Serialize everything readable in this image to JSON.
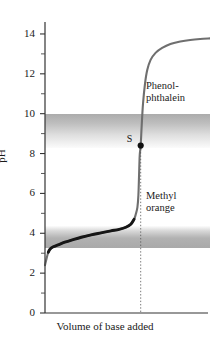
{
  "figure": {
    "kind": "titration-curve"
  },
  "axes": {
    "y_label": "pH",
    "x_label": "Volume of base added",
    "y_ticks_labeled": [
      "14",
      "12",
      "10",
      "8",
      "6",
      "4",
      "2",
      "0"
    ],
    "y_tick_values": [
      14,
      12,
      10,
      8,
      6,
      4,
      2,
      0
    ],
    "y_minor_values": [
      13,
      11,
      9,
      7,
      5,
      3,
      1
    ]
  },
  "annotations": {
    "phenolphthalein_line1": "Phenol-",
    "phenolphthalein_line2": "phthalein",
    "methylorange_line1": "Methyl",
    "methylorange_line2": "orange",
    "equivalence_point_label": "S"
  },
  "colors": {
    "curve": "#6f6f6f",
    "curve_buffer": "#161616",
    "axis": "#333333",
    "band": "#9a9a9a",
    "text": "#1a1a1a",
    "point": "#111111",
    "background": "#ffffff"
  },
  "chart_data": {
    "type": "line",
    "title": "",
    "xlabel": "Volume of base added",
    "ylabel": "pH",
    "ylim": [
      0,
      14.6
    ],
    "xlim": [
      0,
      100
    ],
    "grid": false,
    "legend": "none",
    "y_ticks": [
      0,
      2,
      4,
      6,
      8,
      10,
      12,
      14
    ],
    "x_ticks": [],
    "series": [
      {
        "name": "Titration curve (weak acid vs strong base)",
        "x": [
          0,
          1,
          2,
          3,
          5,
          8,
          12,
          17,
          22,
          28,
          34,
          40,
          45,
          49,
          52,
          54,
          55,
          56,
          56.6,
          57,
          57.4,
          58,
          58.6,
          59.4,
          60.6,
          62,
          64,
          67,
          71,
          76,
          82,
          88,
          94,
          100
        ],
        "y": [
          2.4,
          2.75,
          3.05,
          3.2,
          3.32,
          3.42,
          3.55,
          3.68,
          3.8,
          3.92,
          4.02,
          4.12,
          4.2,
          4.3,
          4.45,
          4.7,
          4.95,
          5.3,
          5.9,
          6.9,
          7.9,
          8.4,
          9.4,
          10.5,
          11.5,
          12.2,
          12.7,
          13.05,
          13.3,
          13.5,
          13.62,
          13.7,
          13.75,
          13.78
        ]
      }
    ],
    "markers": [
      {
        "label": "S",
        "description": "equivalence point / stoichiometric point",
        "x": 58,
        "y": 8.4
      }
    ],
    "shaded_bands": [
      {
        "name": "Phenolphthalein transition range",
        "label": "Phenolphthalein",
        "y_min": 8.3,
        "y_max": 10.0,
        "gradient": "darker at top, fading downward"
      },
      {
        "name": "Methyl orange transition range",
        "label": "Methyl orange",
        "y_min": 3.25,
        "y_max": 4.35,
        "gradient": "darker at bottom, fading upward"
      }
    ],
    "reference_lines": [
      {
        "name": "equivalence-point-dropline",
        "orientation": "vertical",
        "x": 58,
        "from_y": 0,
        "to_y": 8.4,
        "style": "dotted"
      }
    ]
  }
}
